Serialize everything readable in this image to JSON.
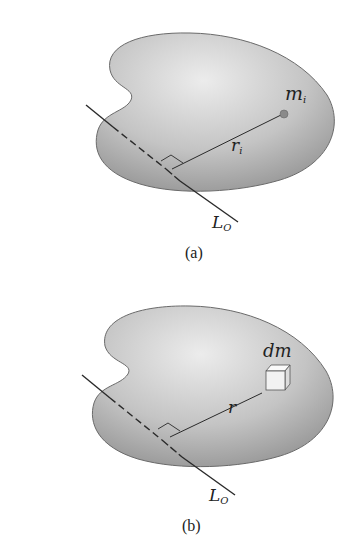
{
  "figures": [
    {
      "id": "a",
      "caption": "(a)",
      "axis_label": {
        "main": "L",
        "sub": "O"
      },
      "element_label": {
        "main": "m",
        "sub": "i"
      },
      "radius_label": {
        "main": "r",
        "sub": "i"
      },
      "element_type": "point-mass"
    },
    {
      "id": "b",
      "caption": "(b)",
      "axis_label": {
        "main": "L",
        "sub": "O"
      },
      "element_label": {
        "main": "dm",
        "sub": ""
      },
      "radius_label": {
        "main": "r",
        "sub": ""
      },
      "element_type": "differential-cube"
    }
  ],
  "colors": {
    "body_fill_light": "#e8e8e8",
    "body_fill_dark": "#9a9a9a",
    "body_outline": "#6a6a6a",
    "line": "#2a2a2a",
    "mass_point": "#8a8a8a"
  }
}
